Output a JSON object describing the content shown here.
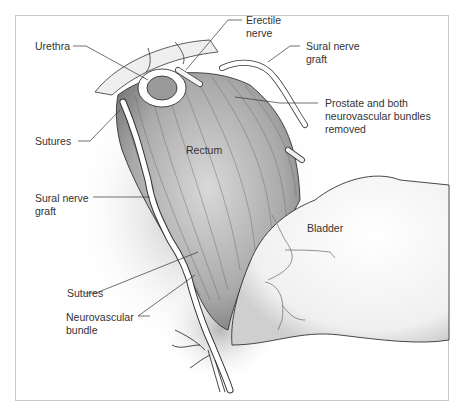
{
  "figure": {
    "labels": {
      "urethra": "Urethra",
      "erectile_nerve_1": "Erectile",
      "erectile_nerve_2": "nerve",
      "sural_graft_top_1": "Sural nerve",
      "sural_graft_top_2": "graft",
      "prostate_1": "Prostate and both",
      "prostate_2": "neurovascular bundles",
      "prostate_3": "removed",
      "sutures_top": "Sutures",
      "rectum": "Rectum",
      "sural_graft_left_1": "Sural nerve",
      "sural_graft_left_2": "graft",
      "bladder": "Bladder",
      "sutures_bottom": "Sutures",
      "nvb_1": "Neurovascular",
      "nvb_2": "bundle"
    },
    "colors": {
      "line": "#333333",
      "shade": "#8a8a8a",
      "frame": "#c8c8c8"
    }
  }
}
